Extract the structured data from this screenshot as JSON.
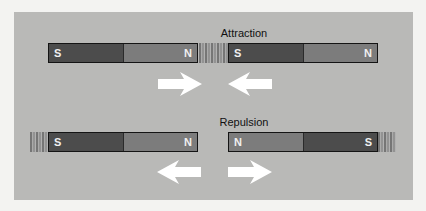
{
  "diagram": {
    "background_color": "#b9b9b7",
    "attraction": {
      "title": "Attraction",
      "left_magnet": {
        "left_pole": "S",
        "right_pole": "N"
      },
      "right_magnet": {
        "left_pole": "S",
        "right_pole": "N"
      },
      "arrows": [
        "right-arrow",
        "left-arrow"
      ]
    },
    "repulsion": {
      "title": "Repulsion",
      "left_magnet": {
        "left_pole": "S",
        "right_pole": "N"
      },
      "right_magnet": {
        "left_pole": "N",
        "right_pole": "S"
      },
      "arrows": [
        "left-arrow",
        "right-arrow"
      ]
    }
  }
}
